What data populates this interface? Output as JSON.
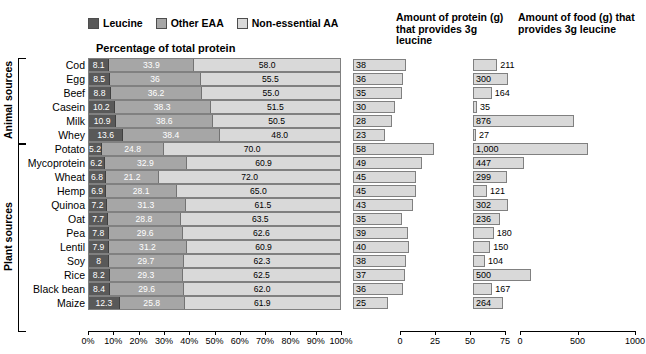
{
  "legend": {
    "items": [
      {
        "label": "Leucine",
        "color": "#595959"
      },
      {
        "label": "Other EAA",
        "color": "#a6a6a6"
      },
      {
        "label": "Non-essential AA",
        "color": "#d9d9d9"
      }
    ]
  },
  "panels": {
    "left_subtitle": "Percentage of total protein",
    "middle_title": "Amount of protein (g) that provides 3g leucine",
    "right_title": "Amount of food (g) that provides 3g leucine"
  },
  "groups": [
    {
      "name": "Animal sources",
      "count": 6
    },
    {
      "name": "Plant sources",
      "count": 11
    }
  ],
  "axes": {
    "left_ticks": [
      "0%",
      "10%",
      "20%",
      "30%",
      "40%",
      "50%",
      "60%",
      "70%",
      "80%",
      "90%",
      "100%"
    ],
    "middle_ticks": [
      "0",
      "25",
      "50",
      "75"
    ],
    "right_ticks": [
      "0",
      "500",
      "1000"
    ]
  },
  "chart_data": {
    "type": "bar",
    "subtitle": "Percentage of total protein",
    "categories": [
      "Cod",
      "Egg",
      "Beef",
      "Casein",
      "Milk",
      "Whey",
      "Potato",
      "Mycoprotein",
      "Wheat",
      "Hemp",
      "Quinoa",
      "Oat",
      "Pea",
      "Lentil",
      "Soy",
      "Rice",
      "Black bean",
      "Maize"
    ],
    "groups": {
      "Animal sources": [
        "Cod",
        "Egg",
        "Beef",
        "Casein",
        "Milk",
        "Whey"
      ],
      "Plant sources": [
        "Potato",
        "Mycoprotein",
        "Wheat",
        "Hemp",
        "Quinoa",
        "Oat",
        "Pea",
        "Lentil",
        "Soy",
        "Rice",
        "Black bean",
        "Maize"
      ]
    },
    "series": [
      {
        "name": "Leucine",
        "values": [
          8.1,
          8.5,
          8.8,
          10.2,
          10.9,
          13.6,
          5.2,
          6.2,
          6.8,
          6.9,
          7.2,
          7.7,
          7.8,
          7.9,
          8,
          8.2,
          8.4,
          12.3
        ]
      },
      {
        "name": "Other EAA",
        "values": [
          33.9,
          36,
          36.2,
          38.3,
          38.6,
          38.4,
          24.8,
          32.9,
          21.2,
          28.1,
          31.3,
          28.8,
          29.6,
          31.2,
          29.7,
          29.3,
          29.6,
          25.8
        ]
      },
      {
        "name": "Non-essential AA",
        "values": [
          58.0,
          55.5,
          55.0,
          51.5,
          50.5,
          48.0,
          70.0,
          60.9,
          72.0,
          65.0,
          61.5,
          63.5,
          62.6,
          60.9,
          62.3,
          62.5,
          62.0,
          61.9
        ]
      }
    ],
    "protein_g_for_3g_leucine": {
      "label": "Amount of protein (g) that provides 3g leucine",
      "xlim": [
        0,
        75
      ],
      "values": [
        38,
        36,
        35,
        30,
        28,
        23,
        58,
        49,
        45,
        45,
        43,
        35,
        39,
        40,
        38,
        37,
        36,
        25
      ]
    },
    "food_g_for_3g_leucine": {
      "label": "Amount of food (g) that provides 3g leucine",
      "xlim": [
        0,
        1000
      ],
      "values": [
        211,
        300,
        164,
        35,
        876,
        27,
        1000,
        447,
        299,
        121,
        302,
        236,
        180,
        150,
        104,
        500,
        167,
        264
      ]
    },
    "xlabel": "",
    "ylabel": "",
    "grid": false,
    "legend_position": "top"
  },
  "rows": [
    {
      "name": "Cod",
      "leucine": "8.1",
      "eaa": "33.9",
      "ne": "58.0",
      "protein": "38",
      "food": "211"
    },
    {
      "name": "Egg",
      "leucine": "8.5",
      "eaa": "36",
      "ne": "55.5",
      "protein": "36",
      "food": "300"
    },
    {
      "name": "Beef",
      "leucine": "8.8",
      "eaa": "36.2",
      "ne": "55.0",
      "protein": "35",
      "food": "164"
    },
    {
      "name": "Casein",
      "leucine": "10.2",
      "eaa": "38.3",
      "ne": "51.5",
      "protein": "30",
      "food": "35"
    },
    {
      "name": "Milk",
      "leucine": "10.9",
      "eaa": "38.6",
      "ne": "50.5",
      "protein": "28",
      "food": "876"
    },
    {
      "name": "Whey",
      "leucine": "13.6",
      "eaa": "38.4",
      "ne": "48.0",
      "protein": "23",
      "food": "27"
    },
    {
      "name": "Potato",
      "leucine": "5.2",
      "eaa": "24.8",
      "ne": "70.0",
      "protein": "58",
      "food": "1,000"
    },
    {
      "name": "Mycoprotein",
      "leucine": "6.2",
      "eaa": "32.9",
      "ne": "60.9",
      "protein": "49",
      "food": "447"
    },
    {
      "name": "Wheat",
      "leucine": "6.8",
      "eaa": "21.2",
      "ne": "72.0",
      "protein": "45",
      "food": "299"
    },
    {
      "name": "Hemp",
      "leucine": "6.9",
      "eaa": "28.1",
      "ne": "65.0",
      "protein": "45",
      "food": "121"
    },
    {
      "name": "Quinoa",
      "leucine": "7.2",
      "eaa": "31.3",
      "ne": "61.5",
      "protein": "43",
      "food": "302"
    },
    {
      "name": "Oat",
      "leucine": "7.7",
      "eaa": "28.8",
      "ne": "63.5",
      "protein": "35",
      "food": "236"
    },
    {
      "name": "Pea",
      "leucine": "7.8",
      "eaa": "29.6",
      "ne": "62.6",
      "protein": "39",
      "food": "180"
    },
    {
      "name": "Lentil",
      "leucine": "7.9",
      "eaa": "31.2",
      "ne": "60.9",
      "protein": "40",
      "food": "150"
    },
    {
      "name": "Soy",
      "leucine": "8",
      "eaa": "29.7",
      "ne": "62.3",
      "protein": "38",
      "food": "104"
    },
    {
      "name": "Rice",
      "leucine": "8.2",
      "eaa": "29.3",
      "ne": "62.5",
      "protein": "37",
      "food": "500"
    },
    {
      "name": "Black bean",
      "leucine": "8.4",
      "eaa": "29.6",
      "ne": "62.0",
      "protein": "36",
      "food": "167"
    },
    {
      "name": "Maize",
      "leucine": "12.3",
      "eaa": "25.8",
      "ne": "61.9",
      "protein": "25",
      "food": "264"
    }
  ]
}
